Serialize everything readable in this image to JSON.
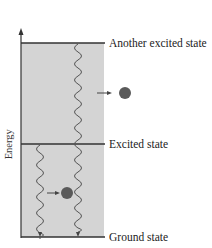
{
  "diagram": {
    "type": "energy-level-diagram",
    "axis_label": "Energy",
    "levels": [
      {
        "name": "Another excited state",
        "label": "Another excited state",
        "y": 43
      },
      {
        "name": "Excited state",
        "label": "Excited state",
        "y": 144
      },
      {
        "name": "Ground state",
        "label": "Ground state",
        "y": 237
      }
    ],
    "transitions": [
      {
        "from": "Another excited state",
        "to": "Ground state",
        "style": "wavy",
        "emits_particle": true
      },
      {
        "from": "Excited state",
        "to": "Ground state",
        "style": "wavy",
        "emits_particle": true
      }
    ],
    "particles": [
      {
        "name": "emitted-photon-upper",
        "color": "#555555"
      },
      {
        "name": "emitted-photon-lower",
        "color": "#555555"
      }
    ],
    "colors": {
      "band_fill": "#d3d3d3",
      "line": "#333333",
      "wave": "#555555",
      "particle": "#5a5a5a"
    }
  }
}
